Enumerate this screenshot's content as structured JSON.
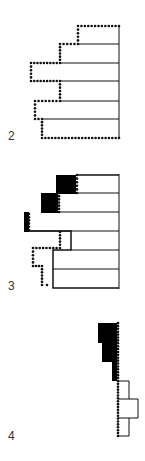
{
  "figures": [
    {
      "id": "fig-2",
      "label": "2"
    },
    {
      "id": "fig-3",
      "label": "3"
    },
    {
      "id": "fig-4",
      "label": "4"
    }
  ],
  "colors": {
    "ink": "#111111",
    "fill": "#000000",
    "label": "#333333",
    "background": "#ffffff"
  }
}
